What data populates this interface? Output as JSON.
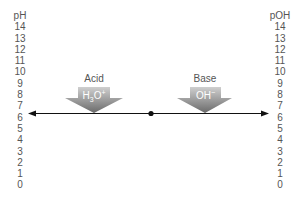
{
  "diagram": {
    "left_scale": {
      "title": "pH",
      "ticks": [
        "14",
        "13",
        "12",
        "11",
        "10",
        "9",
        "8",
        "7",
        "6",
        "5",
        "4",
        "3",
        "2",
        "1",
        "0"
      ]
    },
    "right_scale": {
      "title": "pOH",
      "ticks": [
        "14",
        "13",
        "12",
        "11",
        "10",
        "9",
        "8",
        "7",
        "6",
        "5",
        "4",
        "3",
        "2",
        "1",
        "0"
      ]
    },
    "acid": {
      "label": "Acid",
      "ion": "H3O+",
      "ion_main": "H",
      "ion_sub": "3",
      "ion_rest": "O",
      "ion_sup": "+"
    },
    "base": {
      "label": "Base",
      "ion": "OH−",
      "ion_main": "OH",
      "ion_sup": "−"
    },
    "axis": {
      "line_color": "#000000",
      "neutral_point": "7"
    },
    "colors": {
      "arrow_top": "#c8c8c8",
      "arrow_bottom": "#6e6e6e",
      "text": "#555555"
    }
  }
}
